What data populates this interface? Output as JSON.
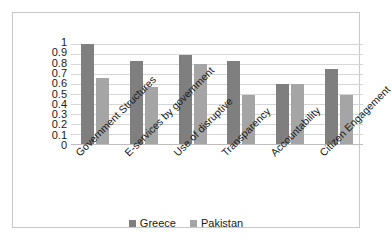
{
  "chart_data": {
    "type": "bar",
    "title": "",
    "subtitle": "",
    "xlabel": "",
    "ylabel": "",
    "ylim": [
      0,
      1
    ],
    "ytick_labels": [
      "1",
      "0.9",
      "0.8",
      "0.7",
      "0.6",
      "0.5",
      "0.4",
      "0.3",
      "0.2",
      "0.1",
      "0"
    ],
    "ytick_values": [
      1,
      0.9,
      0.8,
      0.7,
      0.6,
      0.5,
      0.4,
      0.3,
      0.2,
      0.1,
      0
    ],
    "grid": true,
    "legend_position": "bottom",
    "categories": [
      "Government Structures",
      "E-services by government",
      "Use of disruptive",
      "Transparency",
      "Accountability",
      "Citizen Engagement"
    ],
    "series": [
      {
        "name": "Greece",
        "color": "#7f7f7f",
        "values": [
          1.0,
          0.83,
          0.89,
          0.83,
          0.6,
          0.75
        ]
      },
      {
        "name": "Pakistan",
        "color": "#a5a5a5",
        "values": [
          0.66,
          0.57,
          0.8,
          0.49,
          0.6,
          0.49
        ]
      }
    ]
  },
  "colors": {
    "greece": "#7f7f7f",
    "pakistan": "#a5a5a5",
    "gridline": "#d6d6d6",
    "axis": "#bdbdbd",
    "border": "#c9c9c9",
    "text": "#1a1a1a",
    "background": "#ffffff"
  }
}
